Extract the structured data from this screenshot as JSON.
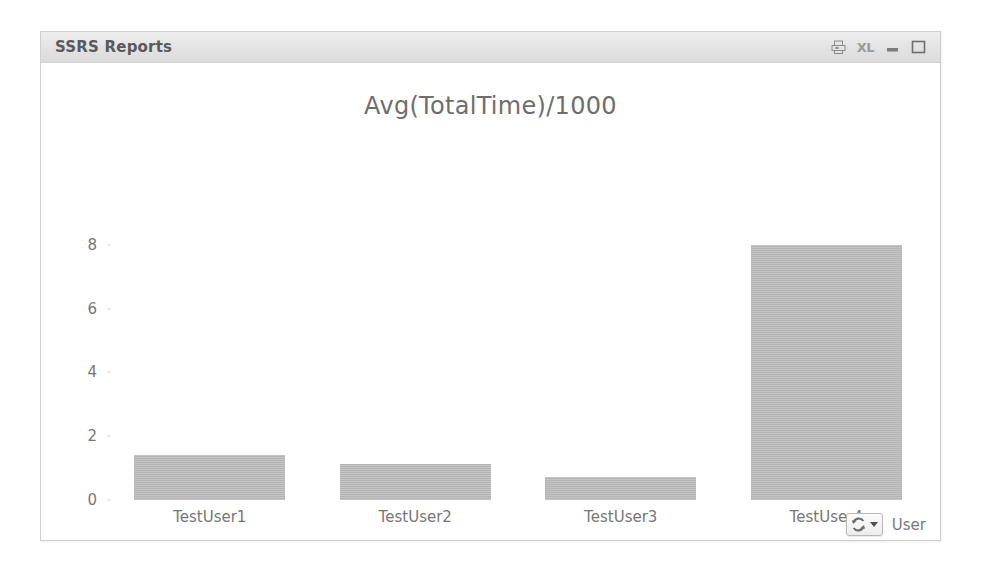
{
  "window": {
    "title": "SSRS Reports",
    "controls": [
      {
        "name": "print-export-icon",
        "label": ""
      },
      {
        "name": "excel-export-icon",
        "label": "XL"
      },
      {
        "name": "minimize-icon",
        "label": ""
      },
      {
        "name": "maximize-icon",
        "label": ""
      }
    ]
  },
  "dimension_control": {
    "icon": "cycle-icon",
    "caret": "chevron-down-icon",
    "label": "User"
  },
  "chart_data": {
    "type": "bar",
    "title": "Avg(TotalTime)/1000",
    "xlabel": "User",
    "ylabel": "",
    "categories": [
      "TestUser1",
      "TestUser2",
      "TestUser3",
      "TestUser4"
    ],
    "values": [
      1.4,
      1.13,
      0.72,
      8.0
    ],
    "ylim": [
      0,
      9
    ],
    "yticks": [
      0,
      2,
      4,
      6,
      8
    ],
    "ytick_labels": [
      "0",
      "2",
      "4",
      "6",
      "8"
    ],
    "grid": false,
    "legend": "none",
    "bar_color": "#b4b4b4",
    "text_color": "#777777",
    "title_color": "#6e6e6e"
  }
}
